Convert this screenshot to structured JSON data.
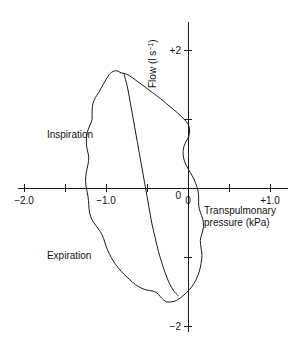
{
  "chart_data": {
    "type": "line",
    "title": "",
    "subtitle": "",
    "xlabel_line1": "Transpulmonary",
    "xlabel_line2": "pressure (kPa)",
    "ylabel_main": "Flow (l s",
    "ylabel_exp": "−1",
    "ylabel_close": ")",
    "xlim": [
      -2.25,
      1.15
    ],
    "ylim": [
      -2.45,
      2.45
    ],
    "grid": false,
    "legend": "none",
    "x_ticks": [
      -2.0,
      -1.5,
      -1.0,
      -0.5,
      0,
      0.5,
      1.0
    ],
    "x_tick_labels": [
      "−2.0",
      "",
      "−1.0",
      "",
      "0",
      "",
      "+1.0"
    ],
    "y_ticks": [
      2,
      1,
      0,
      -1,
      -2
    ],
    "y_tick_labels": [
      "+2",
      "",
      "0",
      "",
      "−2"
    ],
    "annotations": [
      {
        "text": "Inspiration",
        "x": -1.72,
        "y": 0.72
      },
      {
        "text": "Expiration",
        "x": -1.72,
        "y": -1.03
      }
    ],
    "series": [
      {
        "name": "inspiration-limb",
        "comment": "outer left/upper boundary traced counter-clockwise from loop apex",
        "points": [
          [
            -0.82,
            1.67
          ],
          [
            -0.88,
            1.7
          ],
          [
            -0.95,
            1.66
          ],
          [
            -1.0,
            1.57
          ],
          [
            -1.05,
            1.47
          ],
          [
            -1.09,
            1.38
          ],
          [
            -1.13,
            1.31
          ],
          [
            -1.16,
            1.22
          ],
          [
            -1.17,
            1.11
          ],
          [
            -1.17,
            0.99
          ],
          [
            -1.2,
            0.9
          ],
          [
            -1.23,
            0.8
          ],
          [
            -1.24,
            0.68
          ],
          [
            -1.23,
            0.56
          ],
          [
            -1.21,
            0.45
          ],
          [
            -1.22,
            0.34
          ],
          [
            -1.24,
            0.23
          ],
          [
            -1.25,
            0.11
          ],
          [
            -1.24,
            0.0
          ],
          [
            -1.22,
            -0.12
          ],
          [
            -1.21,
            -0.24
          ],
          [
            -1.2,
            -0.36
          ],
          [
            -1.17,
            -0.46
          ],
          [
            -1.12,
            -0.55
          ],
          [
            -1.07,
            -0.63
          ],
          [
            -1.03,
            -0.73
          ],
          [
            -1.0,
            -0.84
          ],
          [
            -0.96,
            -0.95
          ],
          [
            -0.91,
            -1.06
          ],
          [
            -0.85,
            -1.16
          ],
          [
            -0.78,
            -1.25
          ],
          [
            -0.71,
            -1.33
          ],
          [
            -0.64,
            -1.4
          ],
          [
            -0.57,
            -1.45
          ],
          [
            -0.5,
            -1.48
          ],
          [
            -0.44,
            -1.49
          ],
          [
            -0.38,
            -1.52
          ],
          [
            -0.34,
            -1.57
          ],
          [
            -0.3,
            -1.62
          ],
          [
            -0.26,
            -1.65
          ],
          [
            -0.2,
            -1.65
          ],
          [
            -0.14,
            -1.63
          ],
          [
            -0.09,
            -1.59
          ],
          [
            -0.04,
            -1.54
          ]
        ]
      },
      {
        "name": "expiration-limb",
        "comment": "outer right/lower boundary continuing up the right side back to apex",
        "points": [
          [
            -0.04,
            -1.54
          ],
          [
            0.02,
            -1.47
          ],
          [
            0.07,
            -1.39
          ],
          [
            0.11,
            -1.3
          ],
          [
            0.14,
            -1.2
          ],
          [
            0.16,
            -1.09
          ],
          [
            0.17,
            -0.98
          ],
          [
            0.16,
            -0.87
          ],
          [
            0.15,
            -0.76
          ],
          [
            0.17,
            -0.66
          ],
          [
            0.19,
            -0.56
          ],
          [
            0.18,
            -0.45
          ],
          [
            0.15,
            -0.35
          ],
          [
            0.13,
            -0.25
          ],
          [
            0.13,
            -0.14
          ],
          [
            0.12,
            -0.03
          ],
          [
            0.09,
            0.08
          ],
          [
            0.05,
            0.18
          ],
          [
            0.0,
            0.28
          ],
          [
            -0.04,
            0.38
          ],
          [
            -0.06,
            0.49
          ],
          [
            -0.05,
            0.6
          ],
          [
            -0.02,
            0.68
          ],
          [
            0.01,
            0.75
          ],
          [
            0.02,
            0.84
          ],
          [
            0.0,
            0.93
          ],
          [
            -0.05,
            1.0
          ],
          [
            -0.11,
            1.07
          ],
          [
            -0.18,
            1.14
          ],
          [
            -0.26,
            1.22
          ],
          [
            -0.34,
            1.3
          ],
          [
            -0.43,
            1.38
          ],
          [
            -0.52,
            1.46
          ],
          [
            -0.6,
            1.53
          ],
          [
            -0.68,
            1.6
          ],
          [
            -0.75,
            1.65
          ],
          [
            -0.82,
            1.67
          ]
        ]
      },
      {
        "name": "tidal-diagonal",
        "comment": "inner near-straight chord from apex down to loop base",
        "points": [
          [
            -0.78,
            1.65
          ],
          [
            -0.74,
            1.47
          ],
          [
            -0.71,
            1.28
          ],
          [
            -0.68,
            1.08
          ],
          [
            -0.65,
            0.88
          ],
          [
            -0.62,
            0.68
          ],
          [
            -0.59,
            0.48
          ],
          [
            -0.56,
            0.28
          ],
          [
            -0.53,
            0.08
          ],
          [
            -0.5,
            -0.12
          ],
          [
            -0.47,
            -0.32
          ],
          [
            -0.44,
            -0.52
          ],
          [
            -0.4,
            -0.72
          ],
          [
            -0.36,
            -0.92
          ],
          [
            -0.31,
            -1.12
          ],
          [
            -0.25,
            -1.32
          ],
          [
            -0.18,
            -1.48
          ],
          [
            -0.12,
            -1.56
          ]
        ]
      }
    ]
  },
  "geometry": {
    "comment": "pixel mapping used by the renderer (layout aid, derived from the axes)",
    "origin_x": 188,
    "origin_y": 188,
    "px_per_x_unit": 82,
    "px_per_y_unit": 69
  }
}
